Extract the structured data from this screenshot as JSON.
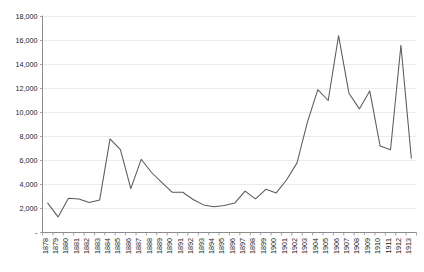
{
  "chart_data": {
    "type": "line",
    "title": "",
    "subtitle": "",
    "xlabel": "",
    "ylabel": "",
    "grid": true,
    "legend": false,
    "legend_position": "none",
    "line_color": "#5a5a5a",
    "grid_color": "#e2e2e2",
    "axis_color": "#7f7f7f",
    "ylim": [
      0,
      18000
    ],
    "ytick_step": 2000,
    "ytick_labels": [
      "-",
      "2,000",
      "4,000",
      "6,000",
      "8,000",
      "10,000",
      "12,000",
      "14,000",
      "16,000",
      "18,000"
    ],
    "ytick_values": [
      0,
      2000,
      4000,
      6000,
      8000,
      10000,
      12000,
      14000,
      16000,
      18000
    ],
    "categories": [
      "1878",
      "1879",
      "1880",
      "1881",
      "1882",
      "1883",
      "1884",
      "1885",
      "1886",
      "1887",
      "1888",
      "1889",
      "1890",
      "1891",
      "1892",
      "1893",
      "1894",
      "1895",
      "1896",
      "1897",
      "1898",
      "1899",
      "1900",
      "1901",
      "1902",
      "1903",
      "1904",
      "1905",
      "1906",
      "1907",
      "1908",
      "1909",
      "1910",
      "1911",
      "1912",
      "1913"
    ],
    "values": [
      2450,
      1300,
      2850,
      2800,
      2500,
      2700,
      7800,
      6900,
      3650,
      6100,
      5000,
      4150,
      3350,
      3350,
      2750,
      2300,
      2150,
      2250,
      2450,
      3450,
      2800,
      3600,
      3300,
      4400,
      5800,
      9200,
      11900,
      11000,
      16400,
      11600,
      10300,
      11800,
      7200,
      6900,
      15600,
      6200
    ]
  }
}
